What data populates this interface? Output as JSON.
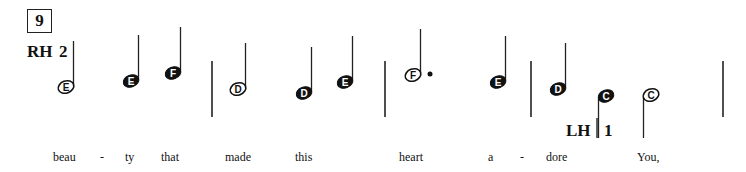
{
  "measure_number": "9",
  "right_hand": {
    "label": "RH",
    "finger": "2"
  },
  "left_hand": {
    "label": "LH",
    "finger": "1"
  },
  "notes": [
    {
      "name": "E",
      "type": "half",
      "x": 66,
      "y": 87,
      "stem": "up"
    },
    {
      "name": "E",
      "type": "quarter",
      "x": 131,
      "y": 81,
      "stem": "up"
    },
    {
      "name": "F",
      "type": "quarter",
      "x": 173,
      "y": 73,
      "stem": "up"
    },
    {
      "name": "D",
      "type": "half",
      "x": 238,
      "y": 89,
      "stem": "up"
    },
    {
      "name": "D",
      "type": "quarter",
      "x": 304,
      "y": 93,
      "stem": "up"
    },
    {
      "name": "E",
      "type": "quarter",
      "x": 345,
      "y": 82,
      "stem": "up"
    },
    {
      "name": "F",
      "type": "dotted-half",
      "x": 413,
      "y": 75,
      "stem": "up"
    },
    {
      "name": "E",
      "type": "quarter",
      "x": 498,
      "y": 82,
      "stem": "up"
    },
    {
      "name": "D",
      "type": "quarter",
      "x": 558,
      "y": 89,
      "stem": "up"
    },
    {
      "name": "C",
      "type": "quarter",
      "x": 606,
      "y": 96,
      "stem": "down"
    },
    {
      "name": "C",
      "type": "half",
      "x": 651,
      "y": 95,
      "stem": "down"
    }
  ],
  "barlines": [
    212,
    385,
    531,
    723
  ],
  "lyrics": [
    {
      "text": "beau",
      "x": 53
    },
    {
      "text": "-",
      "x": 100
    },
    {
      "text": "ty",
      "x": 125
    },
    {
      "text": "that",
      "x": 161
    },
    {
      "text": "made",
      "x": 225
    },
    {
      "text": "this",
      "x": 295
    },
    {
      "text": "heart",
      "x": 399
    },
    {
      "text": "a",
      "x": 488
    },
    {
      "text": "-",
      "x": 520
    },
    {
      "text": "dore",
      "x": 546
    },
    {
      "text": "You,",
      "x": 637
    }
  ]
}
